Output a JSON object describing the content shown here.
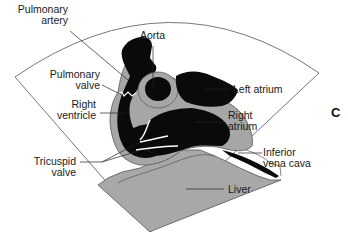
{
  "figure": {
    "panel_letter": "C",
    "labels": {
      "pulmonary_artery": [
        "Pulmonary",
        "artery"
      ],
      "aorta": "Aorta",
      "pulmonary_valve": [
        "Pulmonary",
        "valve"
      ],
      "left_atrium": "Left atrium",
      "right_ventricle": [
        "Right",
        "ventricle"
      ],
      "right_atrium": [
        "Right",
        "atrium"
      ],
      "tricuspid_valve": [
        "Tricuspid",
        "valve"
      ],
      "inferior_vena_cava": [
        "Inferior",
        "vena cava"
      ],
      "liver": "Liver"
    },
    "colors": {
      "blood_black": "#0a0a0a",
      "wall_gray": "#a6a6a6",
      "liver_gray": "#a8a8a8",
      "outline": "#555555",
      "leader": "#222222"
    }
  }
}
